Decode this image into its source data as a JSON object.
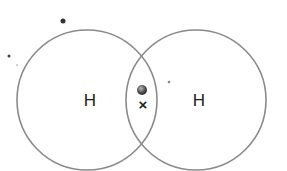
{
  "diagram": {
    "type": "dot-and-cross covalent bond",
    "atoms": [
      {
        "label": "H",
        "cx": 87,
        "cy": 100,
        "r": 70
      },
      {
        "label": "H",
        "cx": 196,
        "cy": 100,
        "r": 70
      }
    ],
    "shared_pair": {
      "dot_electron": {
        "cx": 142,
        "cy": 90,
        "r": 5
      },
      "cross_electron": {
        "symbol": "×",
        "x": 143,
        "y": 110
      }
    },
    "stray_marks": [
      {
        "cx": 63,
        "cy": 21,
        "r": 2.5
      },
      {
        "cx": 9,
        "cy": 56,
        "r": 1.5
      },
      {
        "cx": 17,
        "cy": 65,
        "r": 0.8
      },
      {
        "cx": 169,
        "cy": 82,
        "r": 1.3
      }
    ],
    "colors": {
      "circle_stroke": "#8a8a8a",
      "text": "#222222",
      "dot_fill": "#555555"
    }
  }
}
